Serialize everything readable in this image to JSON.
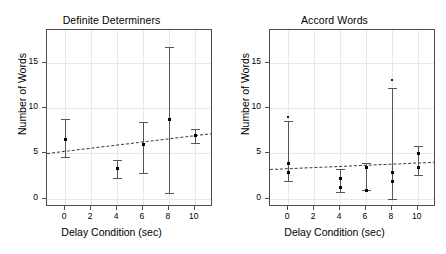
{
  "figure": {
    "background": "#ffffff",
    "point_color": "#000000",
    "errorbar_color": "#555555",
    "trendline_color": "#3a3a3a",
    "grid_color": "#e8e8e8",
    "axis_color": "#4d4d4d"
  },
  "chart_data": [
    {
      "type": "scatter",
      "title": "Definite Determiners",
      "xlabel": "Delay Condition (sec)",
      "ylabel": "Number of Words",
      "xlim": [
        -1.4,
        11.4
      ],
      "ylim": [
        -0.9,
        18.6
      ],
      "xticks": [
        0,
        2,
        4,
        6,
        8,
        10
      ],
      "xtick_labels": [
        "0",
        "2",
        "4",
        "6",
        "8",
        "10"
      ],
      "yticks": [
        0,
        5,
        10,
        15
      ],
      "ytick_labels": [
        "0",
        "5",
        "10",
        "15"
      ],
      "grid": true,
      "legend": "none",
      "x": [
        0,
        4,
        6,
        8,
        10
      ],
      "values": [
        6.6,
        3.4,
        6.0,
        8.8,
        7.0
      ],
      "error_high": [
        8.8,
        4.3,
        8.5,
        16.7,
        7.7
      ],
      "error_low": [
        4.6,
        2.3,
        2.8,
        0.6,
        6.2
      ],
      "extra_points": [],
      "trendline": {
        "type": "dashed",
        "x_start": -1.4,
        "y_start": 5.05,
        "x_end": 11.4,
        "y_end": 7.25
      }
    },
    {
      "type": "scatter",
      "title": "Accord Words",
      "xlabel": "Delay Condition (sec)",
      "ylabel": "Number of Words",
      "xlim": [
        -1.4,
        11.4
      ],
      "ylim": [
        -0.9,
        18.6
      ],
      "xticks": [
        0,
        2,
        4,
        6,
        8,
        10
      ],
      "xtick_labels": [
        "0",
        "2",
        "4",
        "6",
        "8",
        "10"
      ],
      "yticks": [
        0,
        5,
        10,
        15
      ],
      "ytick_labels": [
        "0",
        "5",
        "10",
        "15"
      ],
      "grid": true,
      "legend": "none",
      "x": [
        0,
        4,
        6,
        8,
        10
      ],
      "values": [
        4.0,
        2.3,
        3.5,
        3.0,
        5.1
      ],
      "secondary_values": [
        3.0,
        1.3,
        1.0,
        2.0,
        3.5
      ],
      "error_high": [
        8.6,
        3.3,
        3.9,
        12.2,
        5.8
      ],
      "error_low": [
        2.0,
        0.8,
        1.0,
        0.0,
        2.6
      ],
      "extra_points": [
        {
          "x": 0,
          "y": 9.0
        },
        {
          "x": 8,
          "y": 13.1
        }
      ],
      "trendline": {
        "type": "dashed",
        "x_start": -1.4,
        "y_start": 3.3,
        "x_end": 11.4,
        "y_end": 4.1
      }
    }
  ]
}
